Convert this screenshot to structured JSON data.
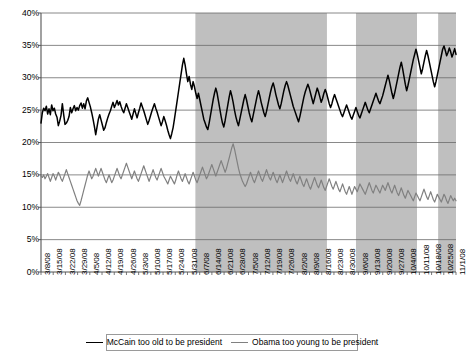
{
  "chart_data": {
    "type": "line",
    "title": "",
    "xlabel": "",
    "ylabel": "",
    "ylim": [
      0,
      40
    ],
    "ytick_step": 5,
    "ytick_labels": [
      "0%",
      "5%",
      "10%",
      "15%",
      "20%",
      "25%",
      "30%",
      "35%",
      "40%"
    ],
    "ytick_values": [
      0,
      5,
      10,
      15,
      20,
      25,
      30,
      35,
      40
    ],
    "grid": true,
    "grid_axis": "y",
    "legend_position": "bottom",
    "x_tick_labels": [
      "3/8/08",
      "3/15/08",
      "3/22/08",
      "3/29/08",
      "4/5/08",
      "4/12/08",
      "4/19/08",
      "4/26/08",
      "5/3/08",
      "5/10/08",
      "5/17/08",
      "5/24/08",
      "5/31/08",
      "6/7/08",
      "6/14/08",
      "6/21/08",
      "6/28/08",
      "7/5/08",
      "7/12/08",
      "7/19/08",
      "7/26/08",
      "8/2/08",
      "8/9/08",
      "8/16/08",
      "8/23/08",
      "8/30/08",
      "9/6/08",
      "9/13/08",
      "9/20/08",
      "9/27/08",
      "10/4/08",
      "10/11/08",
      "10/18/08",
      "10/25/08",
      "11/1/08"
    ],
    "x_range": [
      "3/8/08",
      "11/1/08"
    ],
    "shaded_bands": [
      {
        "start_pct": 37.2,
        "end_pct": 68.9,
        "color": "#bfbfbf"
      },
      {
        "start_pct": 75.9,
        "end_pct": 90.6,
        "color": "#bfbfbf"
      },
      {
        "start_pct": 95.7,
        "end_pct": 100.0,
        "color": "#bfbfbf"
      }
    ],
    "series": [
      {
        "name": "McCain too old to be president",
        "color": "#000000",
        "values": [
          23.0,
          24.6,
          25.3,
          24.9,
          25.6,
          24.4,
          25.2,
          24.3,
          25.8,
          24.9,
          25.3,
          24.4,
          23.9,
          22.6,
          23.3,
          24.2,
          26.0,
          24.3,
          22.8,
          23.0,
          23.4,
          24.0,
          25.4,
          24.6,
          25.2,
          25.7,
          24.9,
          25.4,
          25.0,
          25.7,
          26.1,
          25.3,
          26.0,
          25.2,
          26.4,
          26.9,
          26.2,
          25.5,
          24.6,
          23.6,
          22.5,
          21.2,
          22.4,
          23.6,
          24.3,
          23.5,
          22.7,
          21.9,
          22.3,
          23.1,
          23.8,
          24.4,
          24.9,
          25.6,
          26.2,
          25.4,
          25.9,
          26.5,
          25.8,
          26.3,
          25.6,
          25.0,
          24.6,
          25.3,
          26.0,
          25.4,
          24.8,
          24.2,
          23.6,
          24.4,
          25.2,
          24.5,
          23.8,
          24.6,
          25.3,
          26.1,
          25.5,
          24.9,
          24.2,
          23.5,
          22.8,
          23.4,
          24.1,
          24.8,
          25.4,
          26.0,
          25.3,
          24.7,
          24.0,
          23.3,
          22.6,
          23.2,
          24.0,
          23.4,
          22.7,
          21.9,
          21.2,
          20.6,
          21.4,
          22.3,
          23.6,
          25.0,
          26.4,
          27.8,
          29.2,
          30.6,
          32.0,
          33.0,
          32.0,
          30.6,
          29.4,
          30.2,
          29.0,
          28.2,
          29.4,
          28.6,
          27.6,
          26.8,
          27.6,
          26.6,
          25.6,
          24.6,
          23.6,
          23.0,
          22.4,
          22.0,
          23.0,
          24.2,
          25.4,
          26.6,
          27.6,
          28.4,
          27.6,
          26.4,
          25.2,
          24.0,
          23.0,
          22.4,
          23.4,
          24.6,
          25.8,
          27.0,
          28.0,
          27.2,
          26.2,
          25.0,
          24.0,
          23.2,
          22.6,
          23.6,
          24.6,
          25.6,
          26.6,
          27.4,
          26.6,
          25.6,
          24.6,
          23.8,
          23.2,
          24.2,
          25.2,
          26.2,
          27.2,
          28.0,
          27.2,
          26.2,
          25.4,
          24.6,
          24.0,
          24.8,
          25.8,
          26.8,
          27.8,
          28.6,
          29.2,
          28.4,
          27.4,
          26.6,
          25.8,
          25.2,
          26.0,
          27.0,
          28.0,
          28.8,
          29.4,
          28.8,
          28.0,
          27.2,
          26.4,
          25.6,
          25.0,
          24.4,
          23.8,
          23.2,
          24.0,
          25.0,
          26.0,
          27.0,
          27.8,
          28.4,
          29.0,
          28.4,
          27.6,
          26.8,
          26.0,
          26.8,
          27.6,
          28.4,
          27.8,
          27.0,
          26.2,
          26.8,
          27.6,
          28.2,
          27.6,
          26.8,
          26.0,
          25.4,
          26.0,
          26.8,
          27.4,
          26.8,
          26.2,
          25.6,
          25.0,
          24.4,
          24.0,
          24.6,
          25.2,
          25.8,
          25.2,
          24.6,
          24.0,
          23.6,
          24.2,
          24.8,
          25.4,
          24.8,
          24.2,
          23.8,
          24.4,
          25.0,
          25.6,
          26.2,
          25.6,
          25.0,
          24.6,
          25.2,
          25.8,
          26.4,
          27.0,
          27.6,
          27.0,
          26.4,
          26.0,
          26.6,
          27.2,
          28.0,
          28.8,
          29.6,
          30.4,
          29.6,
          28.6,
          27.6,
          26.8,
          27.6,
          28.6,
          29.6,
          30.6,
          31.6,
          32.4,
          31.4,
          30.2,
          29.0,
          28.0,
          28.8,
          29.8,
          30.8,
          31.8,
          32.8,
          33.6,
          34.4,
          33.6,
          32.6,
          31.6,
          30.6,
          31.4,
          32.4,
          33.4,
          34.2,
          33.4,
          32.4,
          31.4,
          30.4,
          29.4,
          28.6,
          29.4,
          30.4,
          31.4,
          32.4,
          33.4,
          34.4,
          34.9,
          34.2,
          33.4,
          33.9,
          34.6,
          34.0,
          33.2,
          33.8,
          34.5,
          33.6
        ]
      },
      {
        "name": "Obama too young to be president",
        "color": "#808080",
        "values": [
          14.8,
          14.6,
          15.0,
          14.4,
          14.8,
          15.2,
          14.6,
          14.0,
          14.6,
          15.2,
          14.8,
          14.2,
          14.8,
          15.4,
          15.0,
          14.4,
          14.0,
          14.6,
          15.2,
          15.8,
          15.2,
          14.6,
          14.0,
          13.4,
          12.8,
          12.2,
          11.6,
          11.0,
          10.6,
          10.3,
          11.0,
          11.8,
          12.6,
          13.4,
          14.2,
          15.0,
          15.6,
          15.0,
          14.4,
          14.8,
          15.4,
          16.0,
          15.4,
          14.8,
          15.4,
          16.0,
          15.4,
          14.8,
          14.2,
          13.8,
          14.4,
          15.0,
          14.4,
          13.8,
          14.2,
          14.8,
          15.4,
          16.0,
          15.4,
          14.8,
          14.4,
          15.0,
          15.6,
          16.2,
          16.8,
          16.2,
          15.6,
          15.0,
          14.4,
          15.0,
          15.6,
          15.0,
          14.4,
          14.0,
          14.6,
          15.2,
          15.8,
          16.4,
          15.8,
          15.2,
          14.6,
          14.0,
          14.6,
          15.2,
          15.8,
          15.2,
          14.6,
          14.2,
          14.8,
          15.4,
          16.0,
          15.4,
          14.8,
          14.4,
          14.0,
          13.6,
          14.2,
          14.8,
          14.4,
          14.0,
          13.6,
          14.2,
          15.0,
          15.6,
          15.0,
          14.4,
          14.0,
          14.6,
          15.2,
          14.6,
          14.0,
          13.6,
          14.2,
          14.8,
          15.4,
          14.8,
          14.2,
          13.8,
          14.4,
          15.0,
          15.6,
          16.2,
          15.6,
          15.0,
          14.4,
          14.8,
          15.4,
          16.0,
          16.6,
          16.0,
          15.4,
          14.8,
          15.4,
          16.0,
          16.6,
          17.2,
          16.6,
          16.0,
          15.4,
          16.0,
          16.8,
          17.6,
          18.4,
          19.2,
          19.8,
          19.0,
          18.0,
          17.0,
          16.0,
          15.2,
          14.6,
          14.0,
          13.6,
          13.2,
          13.6,
          14.2,
          14.8,
          15.4,
          14.8,
          14.2,
          13.8,
          14.4,
          15.0,
          15.6,
          15.0,
          14.4,
          14.0,
          14.6,
          15.2,
          15.8,
          15.2,
          14.6,
          14.2,
          14.8,
          15.4,
          14.8,
          14.2,
          13.8,
          14.4,
          15.0,
          14.4,
          13.8,
          14.4,
          15.0,
          15.6,
          15.0,
          14.4,
          14.0,
          14.6,
          15.2,
          14.6,
          14.0,
          13.6,
          14.2,
          14.8,
          14.2,
          13.6,
          13.2,
          13.8,
          14.4,
          13.8,
          13.2,
          12.8,
          13.4,
          14.0,
          14.6,
          14.0,
          13.4,
          13.0,
          13.6,
          14.2,
          13.6,
          13.0,
          12.6,
          13.2,
          13.8,
          14.4,
          13.8,
          13.2,
          12.8,
          13.4,
          14.0,
          13.4,
          12.8,
          12.4,
          13.0,
          13.6,
          13.0,
          12.4,
          12.0,
          12.6,
          13.2,
          12.6,
          12.0,
          12.6,
          13.2,
          12.8,
          12.4,
          13.0,
          13.6,
          13.2,
          12.8,
          12.4,
          12.0,
          12.6,
          13.2,
          13.8,
          13.2,
          12.6,
          12.2,
          12.8,
          13.4,
          13.0,
          12.6,
          12.2,
          12.8,
          13.4,
          13.0,
          12.6,
          13.2,
          13.8,
          13.2,
          12.6,
          12.2,
          12.8,
          13.4,
          12.8,
          12.2,
          11.8,
          12.4,
          13.0,
          12.4,
          11.8,
          11.4,
          12.0,
          12.6,
          12.2,
          11.8,
          11.4,
          11.0,
          11.6,
          12.2,
          11.8,
          11.4,
          11.0,
          11.6,
          12.2,
          12.8,
          12.2,
          11.6,
          11.2,
          11.8,
          12.4,
          11.8,
          11.2,
          10.8,
          11.4,
          12.0,
          11.6,
          11.2,
          10.8,
          11.4,
          12.0,
          11.6,
          11.0,
          10.6,
          11.2,
          11.8,
          11.4,
          11.0,
          11.4,
          11.0
        ]
      }
    ]
  },
  "legend": {
    "entries": [
      {
        "label": "McCain too old to be president",
        "color": "#000000"
      },
      {
        "label": "Obama too young to be president",
        "color": "#808080"
      }
    ]
  }
}
